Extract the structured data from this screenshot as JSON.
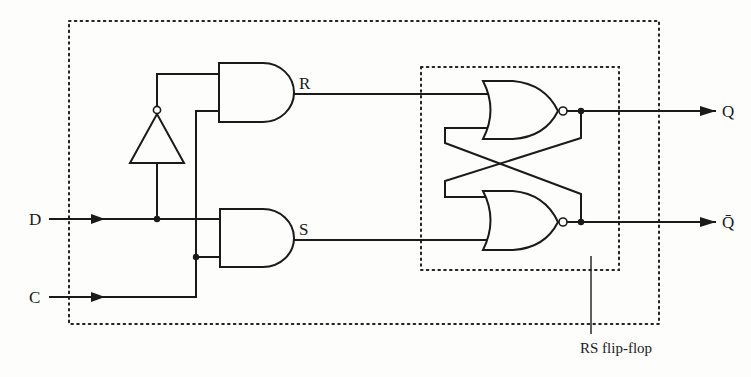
{
  "diagram": {
    "inputs": [
      {
        "id": "D",
        "label": "D"
      },
      {
        "id": "C",
        "label": "C"
      }
    ],
    "outputs": [
      {
        "id": "Q",
        "label": "Q"
      },
      {
        "id": "Qbar",
        "label": "Q̄"
      }
    ],
    "internal_signals": [
      {
        "id": "R",
        "label": "R"
      },
      {
        "id": "S",
        "label": "S"
      }
    ],
    "gates": [
      {
        "id": "inverter",
        "type": "NOT",
        "input": "D",
        "output": "not-D"
      },
      {
        "id": "and-top",
        "type": "AND",
        "inputs": [
          "not-D",
          "C"
        ],
        "output": "R"
      },
      {
        "id": "and-bottom",
        "type": "AND",
        "inputs": [
          "D",
          "C"
        ],
        "output": "S"
      },
      {
        "id": "nor-top",
        "type": "NOR",
        "inputs": [
          "R",
          "Qbar"
        ],
        "output": "Q"
      },
      {
        "id": "nor-bottom",
        "type": "NOR",
        "inputs": [
          "Q",
          "S"
        ],
        "output": "Qbar"
      }
    ],
    "groups": [
      {
        "id": "outer-box",
        "label": ""
      },
      {
        "id": "rs-box",
        "label": "RS flip-flop"
      }
    ],
    "callout": "RS flip-flop"
  }
}
